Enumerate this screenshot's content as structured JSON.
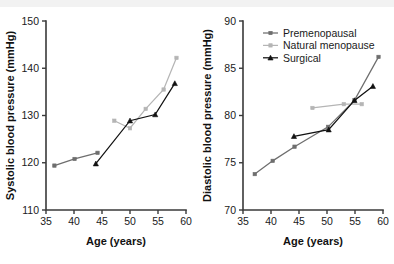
{
  "figure": {
    "background": "#ffffff",
    "top_band_color": "#f2f2f2"
  },
  "legend": {
    "position": "top-left-of-right-panel",
    "entries": [
      {
        "label": "Premenopausal",
        "color": "#6e6e6e",
        "marker": "square"
      },
      {
        "label": "Natural menopause",
        "color": "#b5b5b5",
        "marker": "square"
      },
      {
        "label": "Surgical",
        "color": "#111111",
        "marker": "triangle"
      }
    ]
  },
  "chart_data": [
    {
      "type": "line",
      "id": "systolic",
      "title": "",
      "xlabel": "Age (years)",
      "ylabel": "Systolic blood pressure (mmHg)",
      "xlim": [
        35,
        60
      ],
      "ylim": [
        110,
        150
      ],
      "xticks": [
        35,
        40,
        45,
        50,
        55,
        60
      ],
      "yticks": [
        110,
        120,
        130,
        140,
        150
      ],
      "grid": false,
      "series": [
        {
          "name": "Premenopausal",
          "color": "#6e6e6e",
          "marker": "square",
          "x": [
            36.5,
            40.1,
            44.2
          ],
          "y": [
            119.4,
            120.8,
            122.1
          ]
        },
        {
          "name": "Natural menopause",
          "color": "#b5b5b5",
          "marker": "square",
          "x": [
            47.2,
            50.0,
            52.8,
            56.0,
            58.3
          ],
          "y": [
            128.9,
            127.3,
            131.4,
            135.5,
            142.2
          ]
        },
        {
          "name": "Surgical",
          "color": "#111111",
          "marker": "triangle",
          "x": [
            43.9,
            50.0,
            54.5,
            58.0
          ],
          "y": [
            119.8,
            128.9,
            130.2,
            136.8
          ]
        }
      ]
    },
    {
      "type": "line",
      "id": "diastolic",
      "title": "",
      "xlabel": "Age (years)",
      "ylabel": "Diastolic blood pressure (mmHg)",
      "xlim": [
        35,
        60
      ],
      "ylim": [
        70,
        90
      ],
      "xticks": [
        35,
        40,
        45,
        50,
        55,
        60
      ],
      "yticks": [
        70,
        75,
        80,
        85,
        90
      ],
      "grid": false,
      "series": [
        {
          "name": "Premenopausal",
          "color": "#6e6e6e",
          "marker": "square",
          "x": [
            37.1,
            40.3,
            44.2,
            50.2,
            54.9,
            59.2
          ],
          "y": [
            73.8,
            75.2,
            76.7,
            78.8,
            81.6,
            86.2
          ]
        },
        {
          "name": "Natural menopause",
          "color": "#b5b5b5",
          "marker": "square",
          "x": [
            47.4,
            53.0,
            56.2
          ],
          "y": [
            80.8,
            81.2,
            81.2
          ]
        },
        {
          "name": "Surgical",
          "color": "#111111",
          "marker": "triangle",
          "x": [
            44.1,
            50.3,
            54.9,
            58.2
          ],
          "y": [
            77.8,
            78.5,
            81.6,
            83.1
          ]
        }
      ]
    }
  ]
}
